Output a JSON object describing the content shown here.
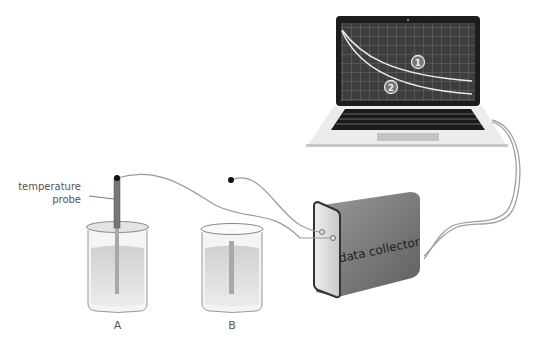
{
  "diagram": {
    "probe_label_line1": "temperature",
    "probe_label_line2": "probe",
    "beaker_a_label": "A",
    "beaker_b_label": "B",
    "collector_label": "data collector",
    "curve_1_label": "1",
    "curve_2_label": "2",
    "colors": {
      "screen_bg": "#3a3a3a",
      "grid": "#8a8a8a",
      "curve": "#e8e8e8",
      "laptop_body": "#e6e6e6",
      "keyboard": "#1a1a1a",
      "collector_side": "#777777",
      "collector_face": "#d6d6d6",
      "wire": "#9a9a9a",
      "liquid": "#d9d9d9"
    }
  }
}
